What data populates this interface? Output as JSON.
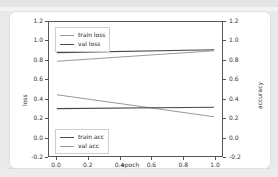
{
  "chart_data": {
    "type": "line",
    "title": "",
    "xlabel": "epoch",
    "ylabel": "loss",
    "y2label": "accuracy",
    "xlim": [
      -0.05,
      1.05
    ],
    "ylim": [
      -0.2,
      1.2
    ],
    "y2lim": [
      -0.2,
      1.2
    ],
    "grid": false,
    "xticks": [
      "0.0",
      "0.2",
      "0.4",
      "0.6",
      "0.8",
      "1.0"
    ],
    "xtick_values": [
      0.0,
      0.2,
      0.4,
      0.6,
      0.8,
      1.0
    ],
    "yticks": [
      "1.2",
      "1.0",
      "0.8",
      "0.6",
      "0.4",
      "0.2",
      "0.0",
      "-0.2"
    ],
    "ytick_values": [
      1.2,
      1.0,
      0.8,
      0.6,
      0.4,
      0.2,
      0.0,
      -0.2
    ],
    "y2ticks": [
      "1.2",
      "1.0",
      "0.8",
      "0.6",
      "0.4",
      "0.2",
      "0.0",
      "-0.2"
    ],
    "y2tick_values": [
      1.2,
      1.0,
      0.8,
      0.6,
      0.4,
      0.2,
      0.0,
      -0.2
    ],
    "x": [
      0.0,
      1.0
    ],
    "series": [
      {
        "name": "train loss",
        "axis": "left",
        "color": "#9a9a9a",
        "values": [
          0.79,
          0.9
        ]
      },
      {
        "name": "val loss",
        "axis": "left",
        "color": "#4a4a4a",
        "values": [
          0.88,
          0.91
        ]
      },
      {
        "name": "train acc",
        "axis": "right",
        "color": "#9a9a9a",
        "values": [
          0.44,
          0.21
        ]
      },
      {
        "name": "val acc",
        "axis": "right",
        "color": "#4a4a4a",
        "values": [
          0.295,
          0.31
        ]
      }
    ],
    "legends": [
      {
        "position": "upper-left",
        "entries": [
          {
            "label": "train loss",
            "color": "#9a9a9a"
          },
          {
            "label": "val loss",
            "color": "#4a4a4a"
          }
        ]
      },
      {
        "position": "lower-left",
        "entries": [
          {
            "label": "train acc",
            "color": "#4a4a4a"
          },
          {
            "label": "val acc",
            "color": "#9a9a9a"
          }
        ]
      }
    ]
  },
  "axis": {
    "x_label": "epoch",
    "y_left_label": "loss",
    "y_right_label": "accuracy"
  },
  "colors": {
    "axis": "#555555",
    "light_series": "#9a9a9a",
    "dark_series": "#4a4a4a",
    "card_bg": "#ffffff",
    "page_bg": "#e9e9e9"
  }
}
